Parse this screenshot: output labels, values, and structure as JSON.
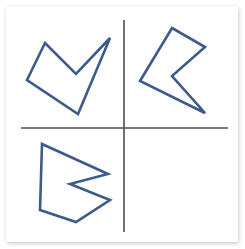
{
  "figure": {
    "title": "",
    "background_color": "#ffffff",
    "plate_color": "#ffffff",
    "width": 245,
    "height": 249
  },
  "axes": {
    "color": "#4d4d4d",
    "stroke_width": 1.6,
    "horizontal": {
      "label": "horizontal-axis",
      "x1": 21,
      "y1": 128,
      "x2": 228,
      "y2": 128
    },
    "vertical": {
      "label": "vertical-axis",
      "x1": 124,
      "y1": 20,
      "x2": 124,
      "y2": 232
    }
  },
  "quadrants": [
    {
      "name": "top-left",
      "occupied": true,
      "shape_id": "shape-v-arrow"
    },
    {
      "name": "top-right",
      "occupied": true,
      "shape_id": "shape-left-chevron"
    },
    {
      "name": "bottom-left",
      "occupied": true,
      "shape_id": "shape-right-chevron"
    },
    {
      "name": "bottom-right",
      "occupied": false,
      "shape_id": ""
    }
  ],
  "shapes": [
    {
      "id": "shape-v-arrow",
      "name": "v-arrow-polygon",
      "quadrant": "top-left",
      "stroke_color": "#3d5a8a",
      "stroke_width": 2.6,
      "fill": "none",
      "closed": true,
      "points": "45,43 27,80 78,114 110,38 76,74",
      "vertices": [
        [
          45,
          43
        ],
        [
          27,
          80
        ],
        [
          78,
          114
        ],
        [
          110,
          38
        ],
        [
          76,
          74
        ]
      ]
    },
    {
      "id": "shape-left-chevron",
      "name": "left-pointing-chevron-polygon",
      "quadrant": "top-right",
      "stroke_color": "#3d5a8a",
      "stroke_width": 2.6,
      "fill": "none",
      "closed": true,
      "points": "172,28 205,47 172,76 205,113 140,81",
      "vertices": [
        [
          172,
          28
        ],
        [
          205,
          47
        ],
        [
          172,
          76
        ],
        [
          205,
          113
        ],
        [
          140,
          81
        ]
      ]
    },
    {
      "id": "shape-right-chevron",
      "name": "right-pointing-chevron-polygon",
      "quadrant": "bottom-left",
      "stroke_color": "#3d5a8a",
      "stroke_width": 2.6,
      "fill": "none",
      "closed": true,
      "points": "42,144 108,174 70,184 110,200 76,222 40,210",
      "vertices": [
        [
          42,
          144
        ],
        [
          108,
          174
        ],
        [
          70,
          184
        ],
        [
          110,
          200
        ],
        [
          76,
          222
        ],
        [
          40,
          210
        ]
      ]
    }
  ]
}
